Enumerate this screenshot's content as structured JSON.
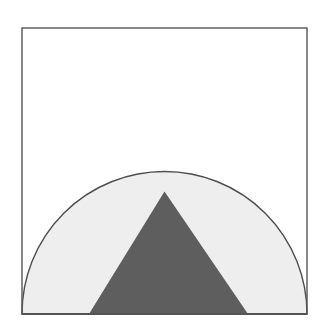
{
  "figure": {
    "title": "Semicircle with inscribed triangle",
    "canvas": {
      "width": 321,
      "height": 325,
      "background": "#ffffff"
    },
    "frame": {
      "name": "square-border",
      "x": 22,
      "y": 28,
      "width": 285,
      "height": 286,
      "stroke": "#555555",
      "stroke_width": 1.4,
      "fill": "none"
    },
    "semicircle": {
      "name": "semicircle-region",
      "center_x": 164.5,
      "center_y": 314,
      "radius": 142.5,
      "fill": "#eeeeee",
      "stroke": "#4d4d4d",
      "stroke_width": 1.4,
      "apex_x": 164.5,
      "apex_y": 191.5,
      "left_base_x": 22,
      "right_base_x": 307,
      "baseline_y": 314
    },
    "triangle": {
      "name": "inscribed-triangle",
      "fill": "#5e5e5e",
      "stroke": "none",
      "apex_x": 164.5,
      "apex_y": 191.5,
      "left_base_x": 89,
      "left_base_y": 314,
      "right_base_x": 248,
      "right_base_y": 314
    },
    "colors": {
      "background": "#ffffff",
      "segment_light": "#eeeeee",
      "segment_dark": "#5e5e5e",
      "outline": "#4d4d4d",
      "frame_stroke": "#555555"
    },
    "baseline": {
      "name": "baseline",
      "x1": 22,
      "x2": 307,
      "y": 314,
      "stroke": "#4d4d4d",
      "stroke_width": 1.4
    }
  }
}
